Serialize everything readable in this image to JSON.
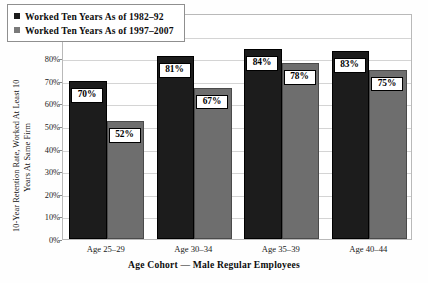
{
  "chart_data": {
    "type": "bar",
    "title": "",
    "subtitle": "",
    "xlabel": "Age Cohort — Male Regular Employees",
    "ylabel": "10-Year Retention Rate, Worked At Least 10 Years At Same Firm",
    "ylabel_line1": "10-Year Retention Rate, Worked At Least 10",
    "ylabel_line2": "Years At Same Firm",
    "categories": [
      "Age 25–29",
      "Age 30–34",
      "Age 35–39",
      "Age 40–44"
    ],
    "series": [
      {
        "name": "Worked Ten Years As of 1982–92",
        "values": [
          70,
          81,
          84,
          83
        ],
        "labels": [
          "70%",
          "81%",
          "84%",
          "83%"
        ],
        "color": "#1c1c1c"
      },
      {
        "name": "Worked Ten Years As of 1997–2007",
        "values": [
          52,
          67,
          78,
          75
        ],
        "labels": [
          "52%",
          "67%",
          "78%",
          "75%"
        ],
        "color": "#6e6e6e"
      }
    ],
    "ylim": [
      0,
      100
    ],
    "ytick_values": [
      0,
      10,
      20,
      30,
      40,
      50,
      60,
      70,
      80,
      90,
      100
    ],
    "ytick_labels": [
      "0%",
      "10%",
      "20%",
      "30%",
      "40%",
      "50%",
      "60%",
      "70%",
      "80%",
      "90%",
      "100%"
    ],
    "grid": true,
    "legend_position": "top-left",
    "value_suffix": "%"
  }
}
